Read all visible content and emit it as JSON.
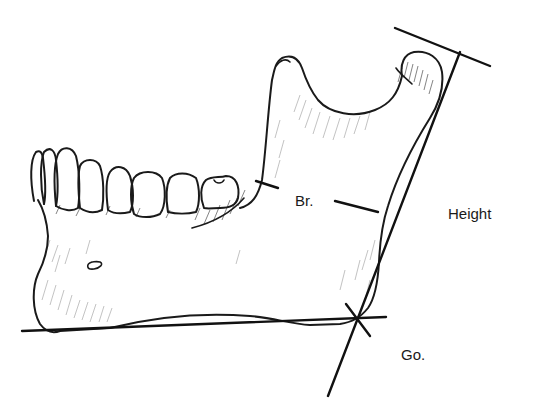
{
  "diagram": {
    "labels": {
      "breadth": "Br.",
      "height": "Height",
      "gonion": "Go."
    },
    "colors": {
      "ink": "#1a1a1a",
      "shading": "#9a9a9a",
      "background": "#ffffff"
    },
    "measurements": [
      {
        "name": "breadth",
        "label": "Br.",
        "description": "Minimum ramus breadth between anterior and posterior borders of the ramus"
      },
      {
        "name": "height",
        "label": "Height",
        "description": "Ramus height, tangent line from gonion to condyle"
      },
      {
        "name": "gonion",
        "label": "Go.",
        "description": "Gonion, intersection of mandibular base line and ramus tangent"
      }
    ]
  }
}
